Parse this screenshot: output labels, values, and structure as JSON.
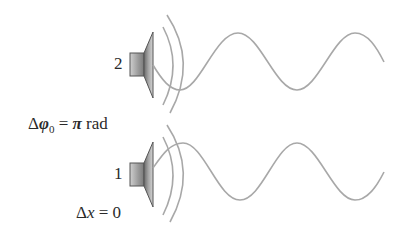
{
  "diagram": {
    "speakers": [
      {
        "id": "2",
        "label": "2",
        "center_y": 65
      },
      {
        "id": "1",
        "label": "1",
        "center_y": 174
      }
    ],
    "phase_label": {
      "delta": "Δ",
      "symbol": "φ",
      "subscript": "0",
      "equals": " = ",
      "value": "π",
      "unit": " rad"
    },
    "position_label": {
      "delta": "Δ",
      "symbol": "x",
      "equals": " = ",
      "value": "0"
    },
    "colors": {
      "wave": "#a8a8a8",
      "speaker_dark": "#555555",
      "speaker_light": "#d8d8d8",
      "text": "#2a2a2a"
    }
  }
}
